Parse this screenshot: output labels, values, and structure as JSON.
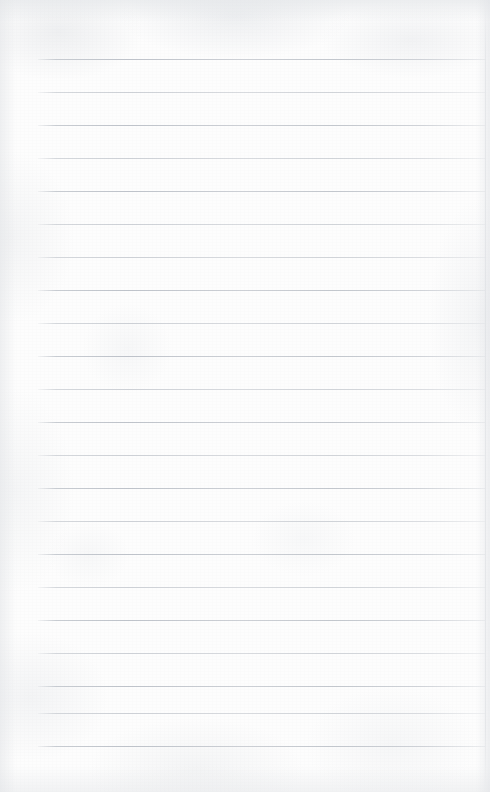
{
  "page": {
    "kind": "blank-ruled-paper",
    "width": 490,
    "height": 792,
    "content_text": "",
    "has_text": false
  },
  "paper": {
    "background_color": "#fdfdfd",
    "texture_tint": "#e6e8eb",
    "edge_shadow_color": "#d6d9dd"
  },
  "rules": {
    "line_color": "#bcc1c8",
    "line_thickness": 1,
    "left_x": 38,
    "right_x": 485,
    "first_line_y": 59,
    "spacing": 33,
    "count": 22,
    "lines": [
      {
        "y": 59,
        "weight": "strong"
      },
      {
        "y": 92,
        "weight": "faint"
      },
      {
        "y": 125,
        "weight": "strong"
      },
      {
        "y": 158,
        "weight": "faint"
      },
      {
        "y": 191,
        "weight": "strong"
      },
      {
        "y": 224,
        "weight": "faint"
      },
      {
        "y": 257,
        "weight": "faint"
      },
      {
        "y": 290,
        "weight": "strong"
      },
      {
        "y": 323,
        "weight": "faint"
      },
      {
        "y": 356,
        "weight": "strong"
      },
      {
        "y": 389,
        "weight": "faint"
      },
      {
        "y": 422,
        "weight": "strong"
      },
      {
        "y": 455,
        "weight": "faint"
      },
      {
        "y": 488,
        "weight": "strong"
      },
      {
        "y": 521,
        "weight": "faint"
      },
      {
        "y": 554,
        "weight": "strong"
      },
      {
        "y": 587,
        "weight": "faint"
      },
      {
        "y": 620,
        "weight": "strong"
      },
      {
        "y": 653,
        "weight": "faint"
      },
      {
        "y": 686,
        "weight": "strong"
      },
      {
        "y": 713,
        "weight": "faint"
      },
      {
        "y": 746,
        "weight": "strong"
      }
    ]
  }
}
